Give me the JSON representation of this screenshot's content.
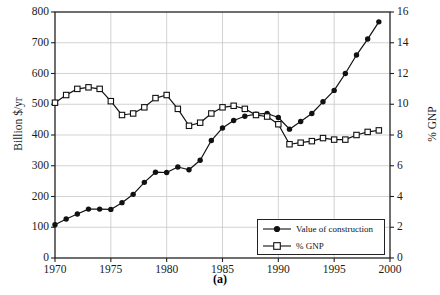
{
  "caption": "(a)",
  "axes": {
    "x": {
      "label": "",
      "min": 1970,
      "max": 2000,
      "ticks": [
        1970,
        1975,
        1980,
        1985,
        1990,
        1995,
        2000
      ],
      "tick_labels": [
        "1970",
        "1975",
        "1980",
        "1985",
        "1990",
        "1995",
        "2000"
      ]
    },
    "y_left": {
      "label": "Billion $/yr",
      "min": 0,
      "max": 800,
      "ticks": [
        0,
        100,
        200,
        300,
        400,
        500,
        600,
        700,
        800
      ],
      "tick_labels": [
        "0",
        "100",
        "200",
        "300",
        "400",
        "500",
        "600",
        "700",
        "800"
      ]
    },
    "y_right": {
      "label": "% GNP",
      "min": 0,
      "max": 16,
      "ticks": [
        0,
        2,
        4,
        6,
        8,
        10,
        12,
        14,
        16
      ],
      "tick_labels": [
        "0",
        "2",
        "4",
        "6",
        "8",
        "10",
        "12",
        "14",
        "16"
      ]
    }
  },
  "legend": {
    "position": "lower-right-inside",
    "entries": [
      {
        "label": "Value of construction",
        "marker": "filled-circle",
        "color": "#111111"
      },
      {
        "label": "% GNP",
        "marker": "open-square",
        "color": "#111111"
      }
    ]
  },
  "style": {
    "background": "#ffffff",
    "frame_color": "#222222",
    "grid_color": "#c8c8c8",
    "series_color": "#111111"
  },
  "chart_data": {
    "type": "line",
    "title": "",
    "subtitle": "",
    "xlabel": "",
    "ylabel": "Billion $/yr",
    "y2label": "% GNP",
    "xlim": [
      1970,
      2000
    ],
    "ylim": [
      0,
      800
    ],
    "y2lim": [
      0,
      16
    ],
    "grid": true,
    "legend_position": "lower right",
    "annotations": [
      "(a)"
    ],
    "x": [
      1970,
      1971,
      1972,
      1973,
      1974,
      1975,
      1976,
      1977,
      1978,
      1979,
      1980,
      1981,
      1982,
      1983,
      1984,
      1985,
      1986,
      1987,
      1988,
      1989,
      1990,
      1991,
      1992,
      1993,
      1994,
      1995,
      1996,
      1997,
      1998,
      1999
    ],
    "series": [
      {
        "name": "Value of construction",
        "axis": "left",
        "units": "Billion $/yr",
        "marker": "filled-circle",
        "values": [
          108,
          127,
          143,
          159,
          159,
          158,
          180,
          207,
          246,
          279,
          278,
          296,
          287,
          318,
          382,
          423,
          447,
          461,
          468,
          470,
          457,
          419,
          444,
          470,
          508,
          545,
          600,
          660,
          712,
          768
        ]
      },
      {
        "name": "% GNP",
        "axis": "right",
        "units": "% GNP",
        "marker": "open-square",
        "values": [
          10.1,
          10.6,
          11.0,
          11.1,
          11.0,
          10.2,
          9.3,
          9.4,
          9.8,
          10.4,
          10.6,
          9.7,
          8.6,
          8.8,
          9.4,
          9.8,
          9.9,
          9.7,
          9.3,
          9.2,
          8.7,
          7.4,
          7.5,
          7.6,
          7.8,
          7.7,
          7.7,
          8.0,
          8.2,
          8.3
        ]
      }
    ]
  }
}
